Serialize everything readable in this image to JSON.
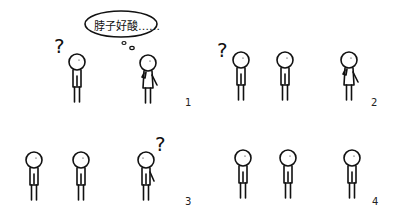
{
  "comic": {
    "panels": [
      {
        "number": "1",
        "speech_bubble": "脖子好酸……",
        "question_mark": "?",
        "figures": [
          "confused-person",
          "thinking-person-hand-on-chin"
        ]
      },
      {
        "number": "2",
        "question_mark": "?",
        "figures": [
          "confused-person",
          "standing-person",
          "thinking-person-hand-on-chin"
        ]
      },
      {
        "number": "3",
        "question_mark": "?",
        "figures": [
          "standing-person",
          "standing-person",
          "confused-person"
        ]
      },
      {
        "number": "4",
        "figures": [
          "standing-person",
          "standing-person",
          "standing-person"
        ]
      }
    ],
    "line_color": "#111111",
    "background": "#ffffff"
  }
}
